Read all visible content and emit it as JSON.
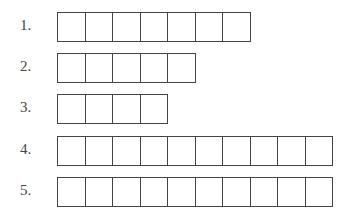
{
  "rows": [
    {
      "label": "1.",
      "boxes": 7
    },
    {
      "label": "2.",
      "boxes": 5
    },
    {
      "label": "3.",
      "boxes": 4
    },
    {
      "label": "4.",
      "boxes": 10
    },
    {
      "label": "5.",
      "boxes": 10
    }
  ]
}
